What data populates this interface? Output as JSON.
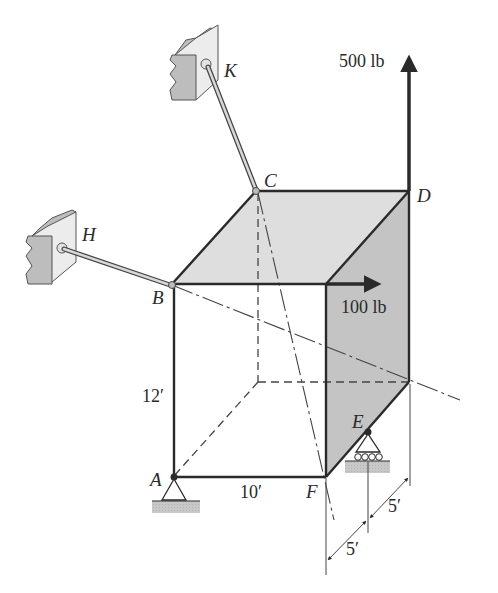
{
  "diagram": {
    "type": "3D rigid body statics (frame/plate) with cable supports",
    "points": {
      "A": "A",
      "B": "B",
      "C": "C",
      "D": "D",
      "E": "E",
      "F": "F",
      "H": "H",
      "K": "K"
    },
    "loads": {
      "vertical_force": "500 lb",
      "horizontal_force": "100 lb"
    },
    "dimensions": {
      "height": "12′",
      "width": "10′",
      "depth_1": "5′",
      "depth_2": "5′"
    },
    "colors": {
      "edge": "#2a2a2a",
      "top_face": "#dedede",
      "side_face": "#c4c4c4",
      "wall": "#d6d6d6",
      "ground": "#c8c8c8",
      "arrow": "#2a2a2a"
    }
  }
}
